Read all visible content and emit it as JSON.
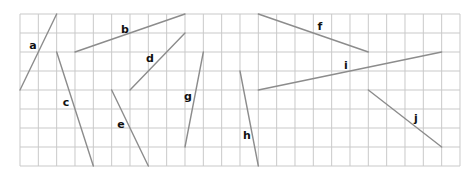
{
  "grid": {
    "origin_x": 20,
    "origin_y": 14,
    "cols": 24,
    "rows": 8,
    "cell_w": 18.333,
    "cell_h": 19,
    "grid_color": "#c9c9c9"
  },
  "segment_color": "#8c8c8c",
  "label_color": "#111111",
  "segments": [
    {
      "label": "a",
      "from": [
        2,
        0
      ],
      "to": [
        0,
        4
      ],
      "label_pos": [
        33,
        45
      ]
    },
    {
      "label": "b",
      "from": [
        3,
        2
      ],
      "to": [
        9,
        0
      ],
      "label_pos": [
        125,
        29
      ]
    },
    {
      "label": "c",
      "from": [
        2,
        2
      ],
      "to": [
        4,
        8
      ],
      "label_pos": [
        66,
        102
      ]
    },
    {
      "label": "d",
      "from": [
        9,
        1
      ],
      "to": [
        6,
        4
      ],
      "label_pos": [
        150,
        58
      ]
    },
    {
      "label": "e",
      "from": [
        5,
        4
      ],
      "to": [
        7,
        8
      ],
      "label_pos": [
        121,
        124
      ]
    },
    {
      "label": "f",
      "from": [
        13,
        0
      ],
      "to": [
        19,
        2
      ],
      "label_pos": [
        320,
        26
      ]
    },
    {
      "label": "g",
      "from": [
        10,
        2
      ],
      "to": [
        9,
        7
      ],
      "label_pos": [
        188,
        96
      ]
    },
    {
      "label": "h",
      "from": [
        12,
        3
      ],
      "to": [
        13,
        8
      ],
      "label_pos": [
        247,
        135
      ]
    },
    {
      "label": "i",
      "from": [
        13,
        4
      ],
      "to": [
        23,
        2
      ],
      "label_pos": [
        346,
        65
      ]
    },
    {
      "label": "j",
      "from": [
        19,
        4
      ],
      "to": [
        23,
        7
      ],
      "label_pos": [
        416,
        118
      ]
    }
  ]
}
